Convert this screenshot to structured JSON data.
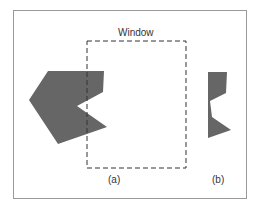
{
  "diagram": {
    "window_label": "Window",
    "panel_a_label": "(a)",
    "panel_b_label": "(b)",
    "colors": {
      "polygon_fill": "#666666",
      "frame_border": "#9a9a9a",
      "window_stroke": "#333333",
      "background": "#ffffff",
      "text": "#333333"
    },
    "window_rect": {
      "x": 87,
      "y": 41,
      "width": 99,
      "height": 127,
      "style": "dashed"
    },
    "polygon_a": {
      "description": "Original polygon partially overlapping the window",
      "points": [
        [
          48,
          71
        ],
        [
          104,
          71
        ],
        [
          103,
          92
        ],
        [
          77,
          106
        ],
        [
          107,
          127
        ],
        [
          58,
          144
        ],
        [
          29,
          100
        ]
      ]
    },
    "polygon_b": {
      "description": "Clipped result of the polygon outside the window",
      "points": [
        [
          208,
          72
        ],
        [
          227,
          72
        ],
        [
          226,
          93
        ],
        [
          210,
          101
        ],
        [
          212,
          117
        ],
        [
          231,
          130
        ],
        [
          208,
          138
        ]
      ]
    }
  }
}
